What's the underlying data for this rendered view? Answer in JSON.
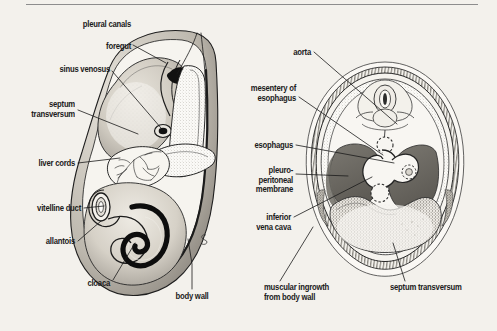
{
  "figure": {
    "background_color": "#f3f1ec",
    "ink_color": "#1b1b1b",
    "rule_color": "#8d8d8d"
  },
  "left_panel": {
    "name": "sagittal-embryo-section",
    "labels": [
      {
        "id": "pleural-canals",
        "text": "pleural canals",
        "x": 197,
        "y": 24,
        "align": "c"
      },
      {
        "id": "foregut",
        "text": "foregut",
        "x": 131,
        "y": 46,
        "align": "r"
      },
      {
        "id": "sinus-venosus",
        "text": "sinus venosus",
        "x": 110,
        "y": 69,
        "align": "r"
      },
      {
        "id": "septum-transversum",
        "text": "septum\ntransversum",
        "x": 75,
        "y": 104,
        "align": "r"
      },
      {
        "id": "liver-cords",
        "text": "liver cords",
        "x": 75,
        "y": 163,
        "align": "r"
      },
      {
        "id": "vitelline-duct",
        "text": "vitelline duct",
        "x": 81,
        "y": 208,
        "align": "r"
      },
      {
        "id": "allantois",
        "text": "allantois",
        "x": 75,
        "y": 241,
        "align": "r"
      },
      {
        "id": "cloaca",
        "text": "cloaca",
        "x": 110,
        "y": 283,
        "align": "r"
      },
      {
        "id": "body-wall",
        "text": "body wall",
        "x": 192,
        "y": 296,
        "align": "c"
      }
    ]
  },
  "right_panel": {
    "name": "transverse-thorax-section",
    "labels": [
      {
        "id": "aorta",
        "text": "aorta",
        "x": 311,
        "y": 52,
        "align": "r"
      },
      {
        "id": "mesentery-of-esophagus",
        "text": "mesentery of\nesophagus",
        "x": 296,
        "y": 93,
        "align": "r"
      },
      {
        "id": "esophagus",
        "text": "esophagus",
        "x": 293,
        "y": 145,
        "align": "r"
      },
      {
        "id": "pleuroperitoneal",
        "text": "pleuro-\nperitoneal\nmembrane",
        "x": 293,
        "y": 174,
        "align": "r"
      },
      {
        "id": "inferior-vena-cava",
        "text": "inferior\nvena cava",
        "x": 291,
        "y": 221,
        "align": "r"
      },
      {
        "id": "muscular-ingrowth",
        "text": "muscular ingrowth\nfrom body wall",
        "x": 264,
        "y": 287,
        "align": "l"
      },
      {
        "id": "septum-transversum-r",
        "text": "septum transversum",
        "x": 390,
        "y": 287,
        "align": "l"
      }
    ]
  },
  "leaders": {
    "pleural-canals": [
      [
        197,
        33
      ],
      [
        190,
        48
      ],
      [
        176,
        75
      ]
    ],
    "pleural-canals-2": [
      [
        202,
        33
      ],
      [
        204,
        52
      ],
      [
        206,
        80
      ]
    ],
    "foregut": [
      [
        133,
        46
      ],
      [
        152,
        52
      ],
      [
        164,
        62
      ]
    ],
    "sinus-venosus": [
      [
        112,
        71
      ],
      [
        140,
        100
      ],
      [
        160,
        128
      ]
    ],
    "septum-transversum": [
      [
        78,
        110
      ],
      [
        110,
        120
      ],
      [
        138,
        134
      ]
    ],
    "liver-cords": [
      [
        78,
        163
      ],
      [
        100,
        161
      ],
      [
        118,
        158
      ]
    ],
    "vitelline-duct": [
      [
        84,
        208
      ],
      [
        95,
        206
      ],
      [
        104,
        204
      ]
    ],
    "allantois": [
      [
        78,
        241
      ],
      [
        90,
        233
      ],
      [
        101,
        222
      ]
    ],
    "cloaca": [
      [
        113,
        281
      ],
      [
        126,
        258
      ],
      [
        133,
        243
      ]
    ],
    "body-wall": [
      [
        192,
        289
      ],
      [
        192,
        265
      ],
      [
        189,
        238
      ]
    ],
    "aorta": [
      [
        314,
        52
      ],
      [
        352,
        84
      ],
      [
        396,
        122
      ]
    ],
    "mesentery": [
      [
        299,
        97
      ],
      [
        340,
        125
      ],
      [
        381,
        152
      ]
    ],
    "esophagus": [
      [
        296,
        145
      ],
      [
        340,
        154
      ],
      [
        392,
        162
      ]
    ],
    "pleuroperitoneal": [
      [
        296,
        174
      ],
      [
        320,
        175
      ],
      [
        346,
        176
      ]
    ],
    "inferior-vena-cava": [
      [
        294,
        218
      ],
      [
        330,
        200
      ],
      [
        370,
        178
      ]
    ],
    "muscular-ingrowth": [
      [
        279,
        281
      ],
      [
        300,
        250
      ],
      [
        312,
        228
      ]
    ],
    "septum-transversum-r": [
      [
        404,
        281
      ],
      [
        400,
        262
      ],
      [
        394,
        244
      ]
    ]
  }
}
